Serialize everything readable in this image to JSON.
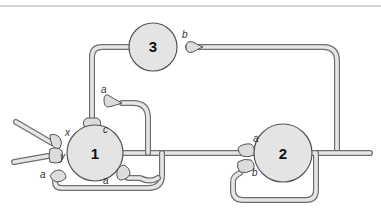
{
  "diagram": {
    "type": "neural-circuit",
    "neurons": [
      {
        "id": "1",
        "label": "1"
      },
      {
        "id": "2",
        "label": "2"
      },
      {
        "id": "3",
        "label": "3"
      }
    ],
    "synapse_labels": {
      "n3_b": "b",
      "n3_to_1_c": "c",
      "n1_a_top": "a",
      "n1_x": "x",
      "n1_y": "y",
      "n1_a_left": "a",
      "n1_a_bottom": "a",
      "n2_a": "a",
      "n2_b": "b"
    },
    "colors": {
      "soma_fill": "#e4e4e4",
      "axon_outline": "#6e6e6e",
      "axon_fill": "#e6e6e6",
      "label": "#333333"
    }
  }
}
